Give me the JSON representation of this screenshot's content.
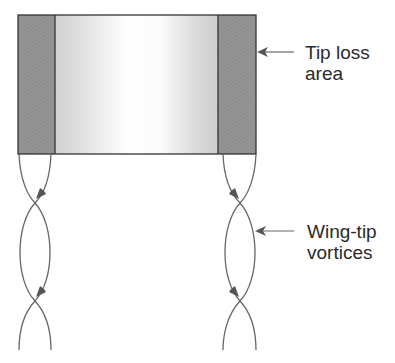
{
  "diagram": {
    "labels": {
      "tip_loss_line1": "Tip loss",
      "tip_loss_line2": "area",
      "vortices_line1": "Wing-tip",
      "vortices_line2": "vortices"
    },
    "colors": {
      "tip_area": "#8f8f8f",
      "wing_light": "#f4f4f4",
      "wing_shade": "#cfcfcf",
      "stroke": "#555555",
      "outline": "#333333"
    }
  }
}
